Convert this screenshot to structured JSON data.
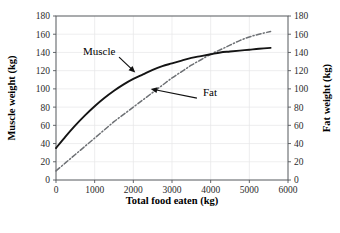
{
  "chart_data": {
    "type": "line",
    "title": "",
    "xlabel": "Total food eaten (kg)",
    "ylabel": "Muscle weight (kg)",
    "y2label": "Fat weight (kg)",
    "xlim": [
      0,
      6000
    ],
    "ylim": [
      0,
      180
    ],
    "y2lim": [
      0,
      180
    ],
    "grid": true,
    "legend_position": "inline-annotations",
    "xticks": [
      0,
      1000,
      2000,
      3000,
      4000,
      5000,
      6000
    ],
    "xtick_labels": [
      "0",
      "1000",
      "2000",
      "3000",
      "4000",
      "5000",
      "6000"
    ],
    "yticks": [
      0,
      20,
      40,
      60,
      80,
      100,
      120,
      140,
      160,
      180
    ],
    "ytick_labels": [
      "0",
      "20",
      "40",
      "60",
      "80",
      "100",
      "120",
      "140",
      "160",
      "180"
    ],
    "y2ticks": [
      0,
      20,
      40,
      60,
      80,
      100,
      120,
      140,
      160,
      180
    ],
    "y2tick_labels": [
      "0",
      "20",
      "40",
      "60",
      "80",
      "100",
      "120",
      "140",
      "160",
      "180"
    ],
    "annotations": [
      {
        "text": "Muscle",
        "x": 700,
        "y": 137,
        "points_to": {
          "x": 2050,
          "y": 118
        }
      },
      {
        "text": "Fat",
        "x": 3800,
        "y": 92,
        "points_to": {
          "x": 2450,
          "y": 100
        }
      }
    ],
    "series": [
      {
        "name": "Muscle",
        "style": "solid",
        "color": "#141414",
        "x": [
          0,
          250,
          500,
          750,
          1000,
          1250,
          1500,
          1750,
          2000,
          2250,
          2500,
          2750,
          3000,
          3250,
          3500,
          3750,
          4000,
          4250,
          4500,
          4750,
          5000,
          5250,
          5550
        ],
        "values": [
          35,
          48,
          60,
          71,
          81,
          90,
          98,
          105,
          111,
          116,
          121,
          125,
          128,
          131,
          134,
          136,
          138,
          140,
          141,
          142,
          143,
          144,
          145
        ]
      },
      {
        "name": "Fat",
        "style": "dash-dot",
        "color": "#6d7074",
        "x": [
          0,
          250,
          500,
          750,
          1000,
          1250,
          1500,
          1750,
          2000,
          2250,
          2500,
          2750,
          3000,
          3250,
          3500,
          3750,
          4000,
          4250,
          4500,
          4750,
          5000,
          5250,
          5550
        ],
        "values": [
          10,
          19,
          28,
          37,
          46,
          55,
          64,
          72,
          80,
          88,
          96,
          104,
          112,
          119,
          126,
          132,
          138,
          143,
          148,
          153,
          157,
          160,
          163
        ]
      }
    ]
  },
  "axes": {
    "x_title": "Total food eaten (kg)",
    "y_left_title": "Muscle weight (kg)",
    "y_right_title": "Fat weight (kg)"
  }
}
